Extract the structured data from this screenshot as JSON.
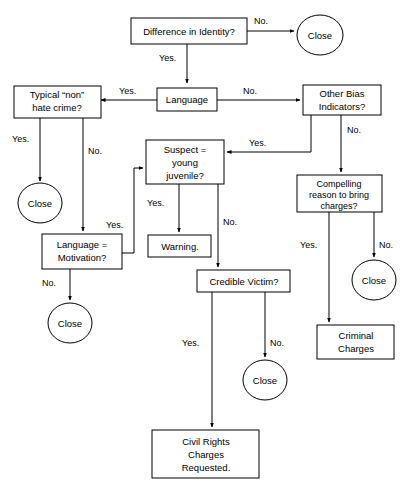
{
  "diagram": {
    "background_color": "#ffffff",
    "line_color": "#000000",
    "text_color": "#000000"
  },
  "nodes": {
    "difference_identity": {
      "label": "Difference in Identity?",
      "shape": "rect"
    },
    "close_1": {
      "label": "Close",
      "shape": "ellipse"
    },
    "typical_non_hate": {
      "label_line1": "Typical “non”",
      "label_line2": "hate crime?",
      "shape": "rect"
    },
    "language": {
      "label": "Language",
      "shape": "rect"
    },
    "other_bias": {
      "label_line1": "Other Bias",
      "label_line2": "Indicators?",
      "shape": "rect"
    },
    "close_2": {
      "label": "Close",
      "shape": "ellipse"
    },
    "suspect_juvenile": {
      "label_line1": "Suspect =",
      "label_line2": "young",
      "label_line3": "juvenile?",
      "shape": "rect"
    },
    "compelling_reason": {
      "label_line1": "Compelling",
      "label_line2": "reason to bring",
      "label_line3": "charges?",
      "shape": "rect"
    },
    "language_motivation": {
      "label_line1": "Language =",
      "label_line2": "Motivation?",
      "shape": "rect"
    },
    "warning": {
      "label": "Warning.",
      "shape": "rect"
    },
    "close_3": {
      "label": "Close",
      "shape": "ellipse"
    },
    "close_5": {
      "label": "Close",
      "shape": "ellipse"
    },
    "credible_victim": {
      "label": "Credible Victim?",
      "shape": "rect"
    },
    "criminal_charges": {
      "label_line1": "Criminal",
      "label_line2": "Charges",
      "shape": "rect"
    },
    "close_4": {
      "label": "Close",
      "shape": "ellipse"
    },
    "civil_rights": {
      "label_line1": "Civil Rights",
      "label_line2": "Charges",
      "label_line3": "Requested.",
      "shape": "rect"
    }
  },
  "edges": {
    "identity_no": "No.",
    "identity_yes": "Yes.",
    "language_yes": "Yes.",
    "language_no": "No.",
    "typical_yes": "Yes.",
    "typical_no": "No.",
    "bias_no": "No.",
    "bias_yes": "Yes.",
    "motivation_yes": "Yes.",
    "motivation_no": "No.",
    "juvenile_yes": "Yes.",
    "juvenile_no": "No.",
    "compelling_yes": "Yes.",
    "compelling_no": "No.",
    "victim_yes": "Yes.",
    "victim_no": "No."
  }
}
